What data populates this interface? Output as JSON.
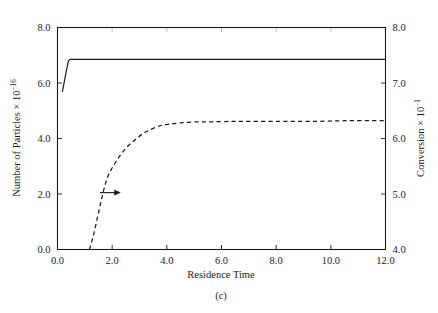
{
  "figure": {
    "caption": "(c)",
    "background_color": "#ffffff",
    "line_color": "#1a1a1a"
  },
  "chart_data": {
    "type": "line",
    "title": "",
    "caption": "(c)",
    "xlabel": "Residence Time",
    "ylabel": "Number of Particles × 10",
    "ylabel_exponent": "−16",
    "y2label": "Conversion × 10",
    "y2label_exponent": "−1",
    "xlim": [
      0.0,
      12.0
    ],
    "ylim": [
      0.0,
      8.0
    ],
    "y2lim": [
      4.0,
      8.0
    ],
    "grid": false,
    "legend": null,
    "xticks": [
      0.0,
      2.0,
      4.0,
      6.0,
      8.0,
      10.0,
      12.0
    ],
    "xtick_labels": [
      "0.0",
      "2.0",
      "4.0",
      "6.0",
      "8.0",
      "10.0",
      "12.0"
    ],
    "yticks": [
      0.0,
      2.0,
      4.0,
      6.0,
      8.0
    ],
    "ytick_labels": [
      "0.0",
      "2.0",
      "4.0",
      "6.0",
      "8.0"
    ],
    "y2ticks": [
      4.0,
      5.0,
      6.0,
      7.0,
      8.0
    ],
    "y2tick_labels": [
      "4.0",
      "5.0",
      "6.0",
      "7.0",
      "8.0"
    ],
    "annotations": [
      {
        "name": "right-axis-arrow",
        "type": "arrow",
        "x": 1.55,
        "y": 2.05,
        "direction": "right",
        "length_data_x": 0.75,
        "note": "arrow indicates dashed curve reads on right axis"
      }
    ],
    "series": [
      {
        "name": "Number of Particles",
        "axis": "left",
        "style": "solid",
        "points": [
          [
            0.18,
            5.7
          ],
          [
            0.25,
            6.05
          ],
          [
            0.32,
            6.42
          ],
          [
            0.4,
            6.8
          ],
          [
            0.46,
            6.85
          ],
          [
            0.8,
            6.85
          ],
          [
            1.5,
            6.85
          ],
          [
            2.5,
            6.85
          ],
          [
            4.0,
            6.85
          ],
          [
            6.0,
            6.85
          ],
          [
            8.0,
            6.85
          ],
          [
            10.0,
            6.85
          ],
          [
            12.0,
            6.85
          ]
        ]
      },
      {
        "name": "Conversion",
        "axis": "right",
        "style": "dashed",
        "points_left_axis_equivalent": [
          [
            1.17,
            0.0
          ],
          [
            1.3,
            0.45
          ],
          [
            1.45,
            1.1
          ],
          [
            1.6,
            1.75
          ],
          [
            1.75,
            2.35
          ],
          [
            1.9,
            2.75
          ],
          [
            2.1,
            3.1
          ],
          [
            2.3,
            3.4
          ],
          [
            2.55,
            3.7
          ],
          [
            2.8,
            3.92
          ],
          [
            3.1,
            4.15
          ],
          [
            3.4,
            4.32
          ],
          [
            3.75,
            4.45
          ],
          [
            4.1,
            4.52
          ],
          [
            4.5,
            4.56
          ],
          [
            5.0,
            4.59
          ],
          [
            5.6,
            4.6
          ],
          [
            6.5,
            4.61
          ],
          [
            7.5,
            4.61
          ],
          [
            8.5,
            4.62
          ],
          [
            9.5,
            4.62
          ],
          [
            10.5,
            4.63
          ],
          [
            11.5,
            4.63
          ],
          [
            12.0,
            4.63
          ]
        ],
        "points_right_axis": [
          [
            1.17,
            4.0
          ],
          [
            1.3,
            4.23
          ],
          [
            1.45,
            4.55
          ],
          [
            1.6,
            4.88
          ],
          [
            1.75,
            5.18
          ],
          [
            1.9,
            5.38
          ],
          [
            2.1,
            5.55
          ],
          [
            2.3,
            5.7
          ],
          [
            2.55,
            5.85
          ],
          [
            2.8,
            5.96
          ],
          [
            3.1,
            6.08
          ],
          [
            3.4,
            6.16
          ],
          [
            3.75,
            6.23
          ],
          [
            4.1,
            6.26
          ],
          [
            4.5,
            6.28
          ],
          [
            5.0,
            6.3
          ],
          [
            5.6,
            6.3
          ],
          [
            6.5,
            6.31
          ],
          [
            7.5,
            6.31
          ],
          [
            8.5,
            6.31
          ],
          [
            9.5,
            6.31
          ],
          [
            10.5,
            6.32
          ],
          [
            11.5,
            6.32
          ],
          [
            12.0,
            6.32
          ]
        ]
      }
    ]
  }
}
